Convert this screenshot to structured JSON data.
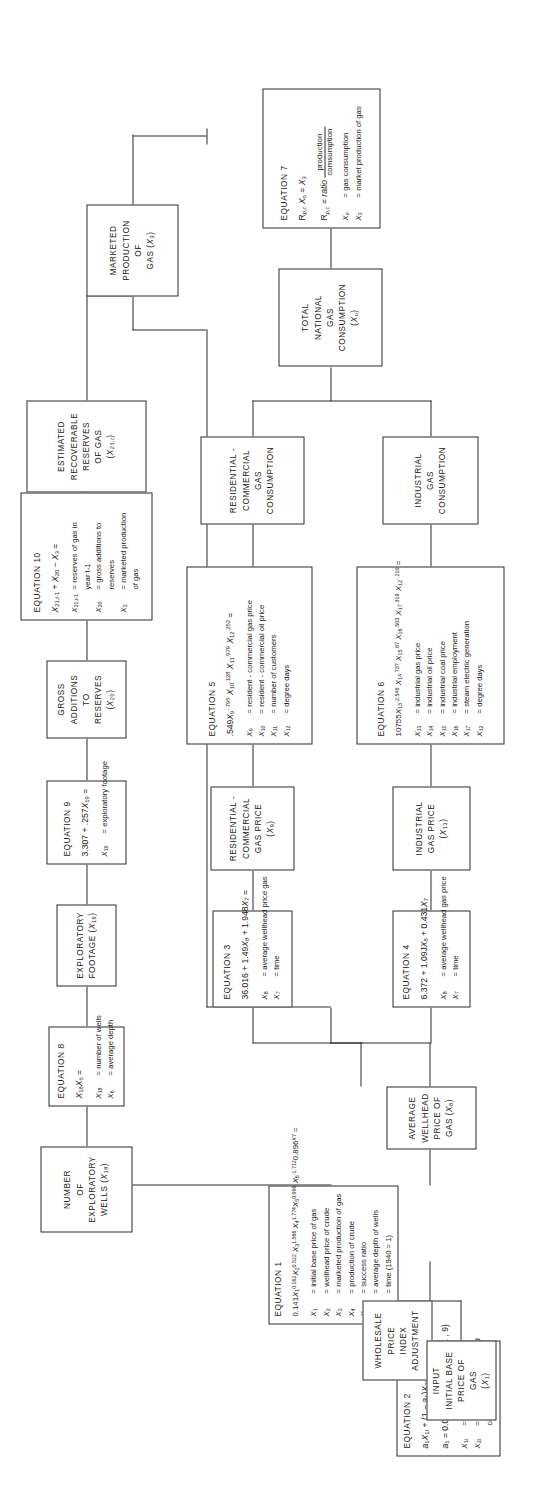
{
  "diagram": {
    "orientation": "rotated-90-ccw",
    "line_color": "#2b2b2b",
    "background": "#ffffff"
  },
  "nodes": {
    "estimated_reserves": {
      "label": "ESTIMATED\nRECOVERABLE\nRESERVES\nOF GAS\n(X21,t)"
    },
    "marketed_production": {
      "label": "MARKETED\nPRODUCTION\nOF\nGAS (X3)"
    },
    "gross_additions": {
      "label": "GROSS\nADDITIONS\nTO RESERVES\n(X20)"
    },
    "exploratory_footage": {
      "label": "EXPLORATORY\nFOOTAGE (X19)"
    },
    "number_of_wells": {
      "label": "NUMBER\nOF\nEXPLORATORY\nWELLS (X18)"
    },
    "total_national_consumption": {
      "label": "TOTAL\nNATIONAL\nGAS\nCONSUMPTION\n(Xo)"
    },
    "residential_consumption": {
      "label": "RESIDENTIAL -\nCOMMERCIAL\nGAS\nCONSUMPTION"
    },
    "industrial_consumption": {
      "label": "INDUSTRIAL\nGAS\nCONSUMPTION"
    },
    "residential_price": {
      "label": "RESIDENTIAL -\nCOMMERCIAL\nGAS PRICE (X9)"
    },
    "industrial_price": {
      "label": "INDUSTRIAL\nGAS PRICE\n(X13)"
    },
    "average_wellhead_price": {
      "label": "AVERAGE\nWELLHEAD\nPRICE OF\nGAS (X8)"
    },
    "input_base_price": {
      "label": "INPUT\nINITIAL BASE\nPRICE OF GAS\n(X1)"
    },
    "wholesale_index": {
      "label": "WHOLESALE\nPRICE\nINDEX\nADJUSTMENT"
    }
  },
  "equations": {
    "eq1": {
      "title": "EQUATION 1",
      "formula": "0.141X1^0.162 X2^0.522 X3^1.566 X4^1.774 X5^0.996 X6^-1.712 0.896^X7 =",
      "defs": [
        {
          "sym": "X1",
          "text": "initial base price of gas"
        },
        {
          "sym": "X2",
          "text": "wellhead price of crude"
        },
        {
          "sym": "X3",
          "text": "marketed production of gas"
        },
        {
          "sym": "X4",
          "text": "production of crude"
        },
        {
          "sym": "X5",
          "text": "success ratio"
        },
        {
          "sym": "X6",
          "text": "average depth of wells"
        },
        {
          "sym": "X7",
          "text": "time (1940 = 1)"
        }
      ]
    },
    "eq2": {
      "title": "EQUATION 2",
      "formula": "a1X1t + (1 - a1)X2t =",
      "formula2": "a1 = 0.06(t - 1961 = 1, . . . . . , 9)",
      "defs": [
        {
          "sym": "X1t",
          "text": "ceiling price of gas"
        },
        {
          "sym": "X2t",
          "text": "price average under old"
        },
        {
          "sym": "",
          "text": "contracts",
          "indent": true
        }
      ]
    },
    "eq3": {
      "title": "EQUATION 3",
      "formula": "36.016 + 1.49X8 + 1.948X7 =",
      "defs": [
        {
          "sym": "X8",
          "text": "average wellhead price gas"
        },
        {
          "sym": "X7",
          "text": "time"
        }
      ]
    },
    "eq4": {
      "title": "EQUATION 4",
      "formula": "6.372 + 1.09JX8 + 0.431X7",
      "defs": [
        {
          "sym": "X8",
          "text": "average wellhead gas price"
        },
        {
          "sym": "X7",
          "text": "time"
        }
      ]
    },
    "eq5": {
      "title": "EQUATION 5",
      "formula": ".549X9^-.795 X10^.128 X11^.979 X12^.252 =",
      "defs": [
        {
          "sym": "X9",
          "text": "resident - commercial gas price"
        },
        {
          "sym": "X10",
          "text": "resident - commercial oil price"
        },
        {
          "sym": "X11",
          "text": "number of customers"
        },
        {
          "sym": "X12",
          "text": "degree days"
        }
      ]
    },
    "eq6": {
      "title": "EQUATION 6",
      "formula": "10755X13^-2.546 X14^.737 X15^.87 X16^.503 X17^.319 X12^-.210 =",
      "defs": [
        {
          "sym": "X13",
          "text": "industrial gas price"
        },
        {
          "sym": "X14",
          "text": "industrial oil price"
        },
        {
          "sym": "X15",
          "text": "industrial coal price"
        },
        {
          "sym": "X16",
          "text": "industrial employment"
        },
        {
          "sym": "X17",
          "text": "steam electric generation"
        },
        {
          "sym": "X12",
          "text": "degree days"
        }
      ]
    },
    "eq7": {
      "title": "EQUATION 7",
      "formula": "Rp,c Xo = X3",
      "formula2": "Rp,c = ratio production / comsumption",
      "defs": [
        {
          "sym": "Xo",
          "text": "gas consumption"
        },
        {
          "sym": "X3",
          "text": "market production of gas"
        }
      ]
    },
    "eq8": {
      "title": "EQUATION 8",
      "formula": "X18 X6 =",
      "defs": [
        {
          "sym": "X18",
          "text": "number of wells"
        },
        {
          "sym": "X6",
          "text": "average depth"
        }
      ]
    },
    "eq9": {
      "title": "EQUATION 9",
      "formula": "3.307 + .257X19 =",
      "defs": [
        {
          "sym": "X19",
          "text": "exploratory footage"
        }
      ]
    },
    "eq10": {
      "title": "EQUATION 10",
      "formula": "X21,t-1 + X20 - X3 =",
      "defs": [
        {
          "sym": "X21,t-1",
          "text": "reserves of gas in"
        },
        {
          "sym": "",
          "text": "year t-1",
          "indent": true
        },
        {
          "sym": "X20",
          "text": "gross additions to"
        },
        {
          "sym": "",
          "text": "reserves",
          "indent": true
        },
        {
          "sym": "X3",
          "text": "marketed production"
        },
        {
          "sym": "",
          "text": "of gas",
          "indent": true
        }
      ]
    }
  }
}
